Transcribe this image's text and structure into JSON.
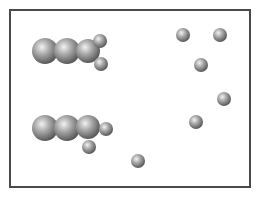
{
  "diagram": {
    "type": "molecular-particle-diagram",
    "frame": {
      "x": 9,
      "y": 9,
      "width": 242,
      "height": 179,
      "border_color": "#4a4a4a"
    },
    "colors": {
      "sphere_highlight": "#f2f2f2",
      "sphere_mid": "#a8a8a8",
      "sphere_shadow": "#5a5a5a"
    },
    "molecules": [
      {
        "name": "molecule-top",
        "atoms": [
          {
            "cx": 45,
            "cy": 51,
            "r": 13,
            "kind": "large"
          },
          {
            "cx": 67,
            "cy": 51,
            "r": 13,
            "kind": "large"
          },
          {
            "cx": 88,
            "cy": 51,
            "r": 12,
            "kind": "large"
          },
          {
            "cx": 100,
            "cy": 41,
            "r": 7,
            "kind": "small"
          },
          {
            "cx": 101,
            "cy": 64,
            "r": 7,
            "kind": "small"
          }
        ]
      },
      {
        "name": "molecule-bottom",
        "atoms": [
          {
            "cx": 45,
            "cy": 128,
            "r": 13,
            "kind": "large"
          },
          {
            "cx": 67,
            "cy": 128,
            "r": 13,
            "kind": "large"
          },
          {
            "cx": 88,
            "cy": 127,
            "r": 12,
            "kind": "large"
          },
          {
            "cx": 106,
            "cy": 129,
            "r": 7,
            "kind": "small"
          },
          {
            "cx": 89,
            "cy": 147,
            "r": 7,
            "kind": "small"
          }
        ]
      }
    ],
    "free_atoms": [
      {
        "cx": 183,
        "cy": 35,
        "r": 7
      },
      {
        "cx": 220,
        "cy": 35,
        "r": 7
      },
      {
        "cx": 201,
        "cy": 65,
        "r": 7
      },
      {
        "cx": 224,
        "cy": 99,
        "r": 7
      },
      {
        "cx": 196,
        "cy": 122,
        "r": 7
      },
      {
        "cx": 138,
        "cy": 161,
        "r": 7
      }
    ]
  }
}
